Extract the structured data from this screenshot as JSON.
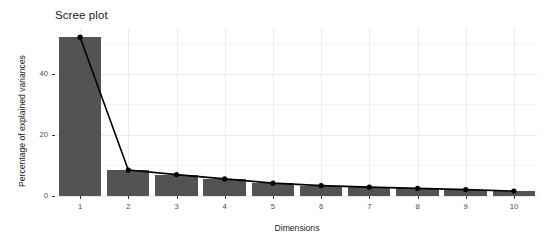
{
  "chart_data": {
    "type": "bar",
    "title": "Scree plot",
    "xlabel": "Dimensions",
    "ylabel": "Percentage of explained variances",
    "categories": [
      "1",
      "2",
      "3",
      "4",
      "5",
      "6",
      "7",
      "8",
      "9",
      "10"
    ],
    "values": [
      52.0,
      8.5,
      7.0,
      5.6,
      4.2,
      3.4,
      2.9,
      2.5,
      2.1,
      1.6
    ],
    "series": [
      {
        "name": "Percentage of explained variances",
        "values": [
          52.0,
          8.5,
          7.0,
          5.6,
          4.2,
          3.4,
          2.9,
          2.5,
          2.1,
          1.6
        ]
      }
    ],
    "overlay_line": {
      "type": "line",
      "marker": "filled-circle",
      "x": [
        "1",
        "2",
        "3",
        "4",
        "5",
        "6",
        "7",
        "8",
        "9",
        "10"
      ],
      "y": [
        52.0,
        8.5,
        7.0,
        5.6,
        4.2,
        3.4,
        2.9,
        2.5,
        2.1,
        1.6
      ]
    },
    "ylim": [
      0,
      55
    ],
    "xlim": [
      0.4,
      10.6
    ],
    "y_ticks": [
      0,
      20,
      40
    ],
    "y_tick_labels": [
      "0",
      "20",
      "40"
    ],
    "y_minor_ticks": [
      10,
      30,
      50
    ],
    "grid": true,
    "legend": "none",
    "bar_color": "#535353",
    "line_color": "#000000",
    "point_color": "#000000",
    "grid_major_color": "#ebebeb",
    "grid_minor_color": "#f4f4f4",
    "panel_background": "#ffffff"
  },
  "axes": {
    "y": {
      "title": "Percentage of explained variances",
      "ticks": [
        {
          "label": "40",
          "value": 40
        },
        {
          "label": "20",
          "value": 20
        },
        {
          "label": "0",
          "value": 0
        }
      ]
    },
    "x": {
      "title": "Dimensions",
      "ticks": [
        {
          "label": "1"
        },
        {
          "label": "2"
        },
        {
          "label": "3"
        },
        {
          "label": "4"
        },
        {
          "label": "5"
        },
        {
          "label": "6"
        },
        {
          "label": "7"
        },
        {
          "label": "8"
        },
        {
          "label": "9"
        },
        {
          "label": "10"
        }
      ]
    }
  }
}
